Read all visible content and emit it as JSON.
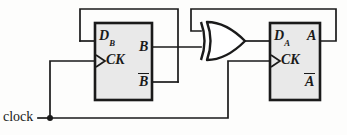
{
  "diagram": {
    "background_color": "#fdfdfc",
    "ink_color": "#1a1a1a",
    "block_fill_color": "#e9e9e9"
  },
  "signals": {
    "clock_label": "clock"
  },
  "flipflop_b": {
    "d_letter": "D",
    "d_subscript": "B",
    "clock_label": "CK",
    "q_label": "B",
    "qbar_label": "B"
  },
  "flipflop_a": {
    "d_letter": "D",
    "d_subscript": "A",
    "clock_label": "CK",
    "q_label": "A",
    "qbar_label": "A"
  },
  "xor_gate": {
    "name": "XOR"
  }
}
